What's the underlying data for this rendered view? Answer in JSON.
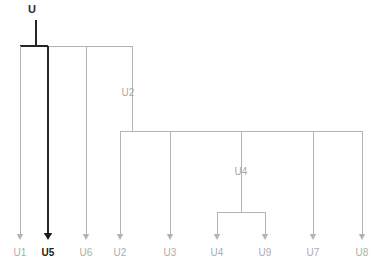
{
  "diagram": {
    "type": "phylogenetic-tree",
    "orientation": "top-down",
    "colors": {
      "branch": "#b4b4b4",
      "branch_highlight": "#262626",
      "label": "#adadad",
      "label_highlight": "#1c1c1c",
      "background": "#ffffff"
    },
    "root": {
      "name": "root-node",
      "label": "U",
      "highlight": true,
      "x": 36,
      "y": 13,
      "stem_top": 20,
      "stem_bottom": 46
    },
    "internal_nodes": [
      {
        "name": "node-u2",
        "label": "U2",
        "label_x": 128,
        "label_y": 96,
        "x": 132,
        "y_top": 46,
        "y_bottom": 131
      },
      {
        "name": "node-u4",
        "label": "U4",
        "label_x": 241,
        "label_y": 175,
        "x": 241,
        "y_top": 131,
        "y_bottom": 212
      }
    ],
    "bars": [
      {
        "name": "root-bar",
        "y": 46,
        "x_start": 20,
        "x_end": 132,
        "highlight_from": 20,
        "highlight_to": 48
      },
      {
        "name": "u2-bar",
        "y": 131,
        "x_start": 120,
        "x_end": 362
      },
      {
        "name": "u4-bar",
        "y": 212,
        "x_start": 217,
        "x_end": 265
      }
    ],
    "leaves": [
      {
        "name": "leaf-u1",
        "label": "U1",
        "x": 20,
        "y_top": 46,
        "highlight": false
      },
      {
        "name": "leaf-u5",
        "label": "U5",
        "x": 48,
        "y_top": 46,
        "highlight": true
      },
      {
        "name": "leaf-u6",
        "label": "U6",
        "x": 86,
        "y_top": 46,
        "highlight": false
      },
      {
        "name": "leaf-u2",
        "label": "U2",
        "x": 120,
        "y_top": 131,
        "highlight": false
      },
      {
        "name": "leaf-u3",
        "label": "U3",
        "x": 170,
        "y_top": 131,
        "highlight": false
      },
      {
        "name": "leaf-u4",
        "label": "U4",
        "x": 217,
        "y_top": 212,
        "highlight": false
      },
      {
        "name": "leaf-u9",
        "label": "U9",
        "x": 265,
        "y_top": 212,
        "highlight": false
      },
      {
        "name": "leaf-u7",
        "label": "U7",
        "x": 313,
        "y_top": 131,
        "highlight": false
      },
      {
        "name": "leaf-u8",
        "label": "U8",
        "x": 362,
        "y_top": 131,
        "highlight": false
      }
    ],
    "leaf_arrow_tip_y": 240,
    "leaf_label_y": 256
  }
}
